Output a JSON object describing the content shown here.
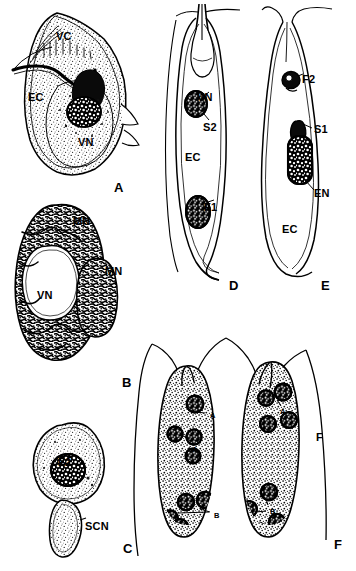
{
  "figure": {
    "background_color": "#ffffff",
    "ink_color": "#000000",
    "width": 356,
    "height": 571
  },
  "panels": [
    {
      "id": "A",
      "letter": "A",
      "caption": "Pollen grain with vegetative cell, generative/egg cell and vegetative nucleus",
      "labels": [
        {
          "text": "VC",
          "x": 56,
          "y": 31,
          "size": "md"
        },
        {
          "text": "EC",
          "x": 28,
          "y": 92,
          "size": "md"
        },
        {
          "text": "VN",
          "x": 78,
          "y": 137,
          "size": "md"
        }
      ]
    },
    {
      "id": "B",
      "letter": "B",
      "caption": "Vegetative nucleus with two male nuclei",
      "labels": [
        {
          "text": "MN",
          "x": 73,
          "y": 216,
          "size": "md"
        },
        {
          "text": "MN",
          "x": 105,
          "y": 266,
          "size": "md"
        },
        {
          "text": "VN",
          "x": 37,
          "y": 290,
          "size": "md"
        }
      ]
    },
    {
      "id": "C",
      "letter": "C",
      "caption": "F2 sperm cell with sperm cell nucleus",
      "labels": [
        {
          "text": "F2",
          "x": 58,
          "y": 457,
          "size": "md"
        },
        {
          "text": "SCN",
          "x": 85,
          "y": 521,
          "size": "md"
        }
      ]
    },
    {
      "id": "D",
      "letter": "D",
      "caption": "Pollen tube containing vegetative nucleus, S2 and F1",
      "labels": [
        {
          "text": "VN",
          "x": 197,
          "y": 92,
          "size": "md"
        },
        {
          "text": "S2",
          "x": 203,
          "y": 122,
          "size": "md"
        },
        {
          "text": "EC",
          "x": 185,
          "y": 152,
          "size": "md"
        },
        {
          "text": "F1",
          "x": 204,
          "y": 202,
          "size": "md"
        }
      ]
    },
    {
      "id": "E",
      "letter": "E",
      "caption": "Pollen tube containing F2, S1, elongate nucleus and egg cell",
      "labels": [
        {
          "text": "F2",
          "x": 302,
          "y": 74,
          "size": "md"
        },
        {
          "text": "S1",
          "x": 316,
          "y": 130,
          "size": "md"
        },
        {
          "text": "EN",
          "x": 316,
          "y": 190,
          "size": "md"
        },
        {
          "text": "EC",
          "x": 284,
          "y": 225,
          "size": "md"
        }
      ]
    },
    {
      "id": "F",
      "letter": "F",
      "caption": "Paired elongate sperm cells with A-group and B-group nuclei",
      "labels": [
        {
          "text": "F",
          "x": 316,
          "y": 434,
          "size": "md"
        },
        {
          "text": "F",
          "x": 334,
          "y": 541,
          "size": "md"
        },
        {
          "text": "A",
          "x": 210,
          "y": 414,
          "size": "tiny"
        },
        {
          "text": "A",
          "x": 194,
          "y": 447,
          "size": "tiny"
        },
        {
          "text": "A",
          "x": 281,
          "y": 410,
          "size": "tiny"
        },
        {
          "text": "B",
          "x": 215,
          "y": 513,
          "size": "tiny"
        },
        {
          "text": "B",
          "x": 271,
          "y": 509,
          "size": "tiny"
        }
      ]
    }
  ],
  "panel_letters": [
    {
      "text": "A",
      "x": 114,
      "y": 181
    },
    {
      "text": "B",
      "x": 122,
      "y": 376
    },
    {
      "text": "C",
      "x": 123,
      "y": 542
    },
    {
      "text": "D",
      "x": 229,
      "y": 279
    },
    {
      "text": "E",
      "x": 321,
      "y": 279
    },
    {
      "text": "F",
      "x": 334,
      "y": 541
    }
  ]
}
